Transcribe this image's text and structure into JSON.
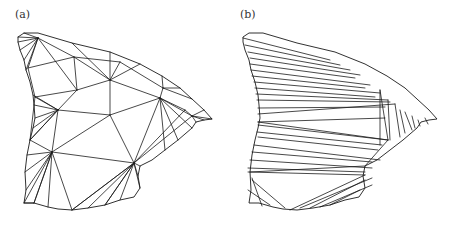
{
  "figure": {
    "panels": [
      {
        "id": "a",
        "label": "(a)",
        "description": "Quality triangulation of polygon region",
        "outline": [
          [
            18,
            37
          ],
          [
            24,
            33
          ],
          [
            38,
            33
          ],
          [
            72,
            43
          ],
          [
            110,
            52
          ],
          [
            140,
            64
          ],
          [
            162,
            76
          ],
          [
            180,
            88
          ],
          [
            192,
            99
          ],
          [
            204,
            110
          ],
          [
            212,
            119
          ],
          [
            204,
            120
          ],
          [
            196,
            122
          ],
          [
            192,
            128
          ],
          [
            178,
            140
          ],
          [
            165,
            150
          ],
          [
            152,
            160
          ],
          [
            140,
            166
          ],
          [
            138,
            176
          ],
          [
            140,
            188
          ],
          [
            134,
            197
          ],
          [
            120,
            200
          ],
          [
            105,
            205
          ],
          [
            88,
            208
          ],
          [
            72,
            210
          ],
          [
            58,
            209
          ],
          [
            48,
            207
          ],
          [
            34,
            203
          ],
          [
            24,
            203
          ],
          [
            26,
            190
          ],
          [
            25,
            172
          ],
          [
            27,
            155
          ],
          [
            30,
            140
          ],
          [
            33,
            128
          ],
          [
            35,
            118
          ],
          [
            34,
            105
          ],
          [
            33,
            95
          ],
          [
            30,
            82
          ],
          [
            26,
            70
          ],
          [
            24,
            60
          ],
          [
            20,
            50
          ],
          [
            18,
            42
          ]
        ],
        "vertices": {
          "A": [
            38,
            38
          ],
          "B": [
            74,
            57
          ],
          "C": [
            110,
            80
          ],
          "D": [
            77,
            90
          ],
          "E": [
            58,
            110
          ],
          "F": [
            110,
            115
          ],
          "G": [
            160,
            98
          ],
          "H": [
            192,
            116
          ],
          "I": [
            52,
            152
          ],
          "J": [
            134,
            163
          ],
          "K": [
            28,
            68
          ],
          "L": [
            35,
            97
          ],
          "M": [
            120,
            62
          ],
          "N": [
            163,
            88
          ],
          "O": [
            185,
            110
          ],
          "P": [
            140,
            188
          ],
          "Q": [
            72,
            210
          ],
          "R": [
            34,
            203
          ],
          "S": [
            24,
            203
          ],
          "T": [
            30,
            140
          ],
          "U": [
            105,
            205
          ],
          "V": [
            48,
            207
          ]
        },
        "edges": [
          [
            "A",
            "B"
          ],
          [
            "A",
            "K"
          ],
          [
            "A",
            "D"
          ],
          [
            "B",
            "D"
          ],
          [
            "B",
            "M"
          ],
          [
            "B",
            "C"
          ],
          [
            "M",
            "C"
          ],
          [
            "C",
            "D"
          ],
          [
            "C",
            "F"
          ],
          [
            "C",
            "G"
          ],
          [
            "M",
            "N"
          ],
          [
            "N",
            "G"
          ],
          [
            "G",
            "H"
          ],
          [
            "G",
            "F"
          ],
          [
            "G",
            "O"
          ],
          [
            "O",
            "H"
          ],
          [
            "D",
            "E"
          ],
          [
            "D",
            "L"
          ],
          [
            "L",
            "E"
          ],
          [
            "K",
            "L"
          ],
          [
            "E",
            "F"
          ],
          [
            "E",
            "I"
          ],
          [
            "E",
            "T"
          ],
          [
            "F",
            "I"
          ],
          [
            "F",
            "J"
          ],
          [
            "G",
            "J"
          ],
          [
            "O",
            "J"
          ],
          [
            "I",
            "J"
          ],
          [
            "I",
            "T"
          ],
          [
            "I",
            "R"
          ],
          [
            "I",
            "V"
          ],
          [
            "I",
            "Q"
          ],
          [
            "J",
            "Q"
          ],
          [
            "J",
            "U"
          ],
          [
            "J",
            "P"
          ],
          [
            "K",
            "B"
          ],
          [
            "L",
            "T"
          ],
          [
            "R",
            "S"
          ],
          [
            "H",
            "J"
          ]
        ],
        "fans": [
          {
            "center": [
              38,
              38
            ],
            "targets": [
              [
                18,
                42
              ],
              [
                20,
                50
              ],
              [
                24,
                60
              ],
              [
                26,
                70
              ],
              [
                24,
                33
              ],
              [
                18,
                37
              ]
            ]
          },
          {
            "center": [
              58,
              110
            ],
            "targets": [
              [
                33,
                95
              ],
              [
                34,
                105
              ],
              [
                35,
                118
              ],
              [
                33,
                128
              ],
              [
                30,
                140
              ]
            ]
          },
          {
            "center": [
              52,
              152
            ],
            "targets": [
              [
                27,
                155
              ],
              [
                25,
                172
              ],
              [
                26,
                190
              ],
              [
                24,
                203
              ],
              [
                34,
                203
              ]
            ]
          },
          {
            "center": [
              134,
              163
            ],
            "targets": [
              [
                72,
                210
              ],
              [
                88,
                208
              ],
              [
                105,
                205
              ],
              [
                120,
                200
              ],
              [
                138,
                176
              ],
              [
                140,
                166
              ]
            ]
          },
          {
            "center": [
              160,
              98
            ],
            "targets": [
              [
                165,
                150
              ],
              [
                178,
                140
              ],
              [
                192,
                128
              ]
            ]
          },
          {
            "center": [
              192,
              116
            ],
            "targets": [
              [
                204,
                110
              ],
              [
                212,
                119
              ],
              [
                204,
                120
              ],
              [
                196,
                122
              ]
            ]
          },
          {
            "center": [
              110,
              80
            ],
            "targets": [
              [
                72,
                43
              ],
              [
                110,
                52
              ],
              [
                140,
                64
              ]
            ]
          },
          {
            "center": [
              163,
              88
            ],
            "targets": [
              [
                162,
                76
              ],
              [
                180,
                88
              ],
              [
                192,
                99
              ]
            ]
          }
        ]
      },
      {
        "id": "b",
        "label": "(b)",
        "description": "Sliver-heavy triangulation of same polygon region",
        "offset_x": 225,
        "stripes": [
          [
            [
              243,
              38
            ],
            [
              330,
              60
            ]
          ],
          [
            [
              245,
              45
            ],
            [
              340,
              65
            ]
          ],
          [
            [
              248,
              52
            ],
            [
              350,
              70
            ]
          ],
          [
            [
              250,
              58
            ],
            [
              360,
              75
            ]
          ],
          [
            [
              250,
              64
            ],
            [
              355,
              78
            ]
          ],
          [
            [
              251,
              70
            ],
            [
              370,
              85
            ]
          ],
          [
            [
              252,
              76
            ],
            [
              365,
              88
            ]
          ],
          [
            [
              254,
              82
            ],
            [
              380,
              93
            ]
          ],
          [
            [
              255,
              88
            ],
            [
              375,
              97
            ]
          ],
          [
            [
              256,
              94
            ],
            [
              388,
              100
            ]
          ],
          [
            [
              257,
              100
            ],
            [
              390,
              102
            ]
          ],
          [
            [
              258,
              108
            ],
            [
              385,
              107
            ]
          ],
          [
            [
              258,
              114
            ],
            [
              395,
              104
            ]
          ],
          [
            [
              258,
              122
            ],
            [
              385,
              118
            ]
          ],
          [
            [
              258,
              125
            ],
            [
              388,
              140
            ]
          ],
          [
            [
              257,
              132
            ],
            [
              382,
              145
            ]
          ],
          [
            [
              258,
              137
            ],
            [
              378,
              150
            ]
          ],
          [
            [
              254,
              145
            ],
            [
              380,
              160
            ]
          ],
          [
            [
              252,
              152
            ],
            [
              372,
              162
            ]
          ],
          [
            [
              250,
              160
            ],
            [
              372,
              168
            ]
          ],
          [
            [
              248,
              168
            ],
            [
              365,
              172
            ]
          ],
          [
            [
              248,
              172
            ],
            [
              365,
              175
            ]
          ]
        ],
        "right_tip_fan": {
          "edges": [
            [
              [
                380,
                90
              ],
              [
                380,
                145
              ]
            ],
            [
              [
                388,
                100
              ],
              [
                390,
                140
              ]
            ],
            [
              [
                395,
                104
              ],
              [
                400,
                137
              ]
            ],
            [
              [
                400,
                110
              ],
              [
                405,
                133
              ]
            ],
            [
              [
                405,
                112
              ],
              [
                412,
                130
              ]
            ],
            [
              [
                412,
                116
              ],
              [
                415,
                128
              ]
            ],
            [
              [
                418,
                120
              ],
              [
                420,
                126
              ]
            ],
            [
              [
                425,
                118
              ],
              [
                428,
                124
              ]
            ]
          ]
        },
        "bottom_fan": {
          "edges": [
            [
              [
                365,
                175
              ],
              [
                290,
                210
              ]
            ],
            [
              [
                372,
                178
              ],
              [
                300,
                208
              ]
            ],
            [
              [
                365,
                180
              ],
              [
                310,
                208
              ]
            ],
            [
              [
                372,
                185
              ],
              [
                320,
                207
              ]
            ],
            [
              [
                360,
                190
              ],
              [
                330,
                205
              ]
            ],
            [
              [
                252,
                180
              ],
              [
                285,
                208
              ]
            ],
            [
              [
                248,
                190
              ],
              [
                270,
                205
              ]
            ],
            [
              [
                252,
                178
              ],
              [
                262,
                206
              ]
            ]
          ]
        },
        "outline": [
          [
            243,
            37
          ],
          [
            249,
            33
          ],
          [
            263,
            33
          ],
          [
            297,
            43
          ],
          [
            335,
            52
          ],
          [
            365,
            64
          ],
          [
            387,
            76
          ],
          [
            405,
            88
          ],
          [
            417,
            99
          ],
          [
            429,
            110
          ],
          [
            437,
            119
          ],
          [
            429,
            120
          ],
          [
            421,
            122
          ],
          [
            417,
            128
          ],
          [
            403,
            140
          ],
          [
            390,
            150
          ],
          [
            377,
            160
          ],
          [
            365,
            166
          ],
          [
            363,
            176
          ],
          [
            365,
            188
          ],
          [
            359,
            197
          ],
          [
            345,
            200
          ],
          [
            330,
            205
          ],
          [
            313,
            208
          ],
          [
            297,
            210
          ],
          [
            283,
            209
          ],
          [
            273,
            207
          ],
          [
            259,
            203
          ],
          [
            249,
            203
          ],
          [
            251,
            190
          ],
          [
            250,
            172
          ],
          [
            252,
            155
          ],
          [
            255,
            140
          ],
          [
            258,
            128
          ],
          [
            260,
            118
          ],
          [
            259,
            105
          ],
          [
            258,
            95
          ],
          [
            255,
            82
          ],
          [
            251,
            70
          ],
          [
            249,
            60
          ],
          [
            245,
            50
          ],
          [
            243,
            42
          ]
        ]
      }
    ]
  }
}
